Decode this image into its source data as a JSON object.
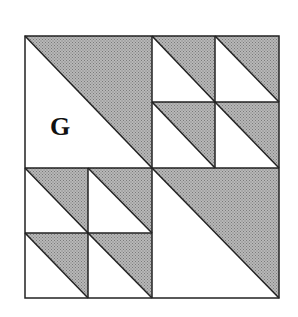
{
  "diagram": {
    "type": "quilt-block",
    "label": "G",
    "colors": {
      "shade": "#a9a9a9",
      "line": "#222222",
      "background": "#ffffff"
    },
    "outer_square": {
      "x": 25,
      "y": 36,
      "width": 254,
      "height": 262
    },
    "quadrants": [
      {
        "position": "top-left",
        "kind": "half-square-triangle",
        "shaded": "upper-right",
        "divisions": 1
      },
      {
        "position": "top-right",
        "kind": "half-square-triangle-grid",
        "shaded": "upper-right",
        "divisions": 2
      },
      {
        "position": "bottom-left",
        "kind": "half-square-triangle-grid",
        "shaded": "upper-right",
        "divisions": 2
      },
      {
        "position": "bottom-right",
        "kind": "half-square-triangle",
        "shaded": "upper-right",
        "divisions": 1
      }
    ]
  }
}
